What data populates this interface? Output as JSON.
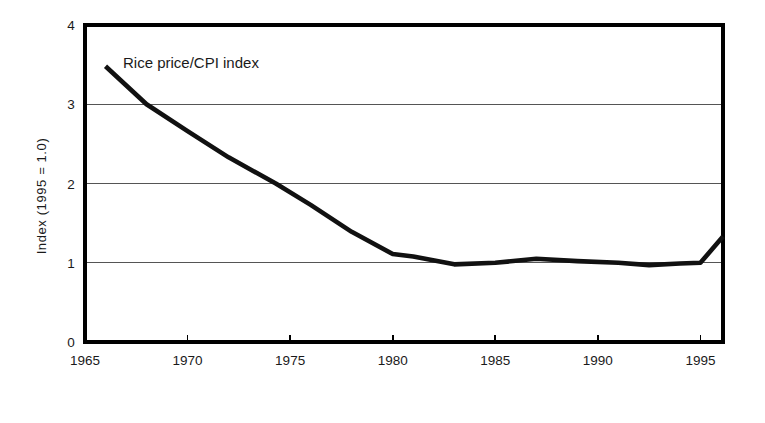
{
  "chart_data": {
    "type": "line",
    "title": "",
    "annotation": "Rice price/CPI index",
    "xlabel": "",
    "ylabel": "Index (1995 = 1.0)",
    "xlim": [
      1965,
      1996.1
    ],
    "ylim": [
      0,
      4
    ],
    "grid": "horizontal",
    "legend_position": "none",
    "xticks": [
      "1965",
      "1970",
      "1975",
      "1980",
      "1985",
      "1990",
      "1995"
    ],
    "xtick_values": [
      1965,
      1970,
      1975,
      1980,
      1985,
      1990,
      1995
    ],
    "yticks": [
      "0",
      "1",
      "2",
      "3",
      "4"
    ],
    "ytick_values": [
      0,
      1,
      2,
      3,
      4
    ],
    "series": [
      {
        "name": "Rice price/CPI index",
        "color": "#111111",
        "x": [
          1966.0,
          1968.0,
          1970.0,
          1972.0,
          1974.3,
          1976.0,
          1978.0,
          1980.0,
          1981.0,
          1983.0,
          1985.0,
          1987.0,
          1989.0,
          1991.0,
          1992.5,
          1994.0,
          1995.0,
          1996.1
        ],
        "values": [
          3.48,
          3.0,
          2.66,
          2.33,
          2.0,
          1.73,
          1.39,
          1.11,
          1.08,
          0.98,
          1.0,
          1.05,
          1.02,
          1.0,
          0.97,
          0.99,
          1.0,
          1.33
        ]
      }
    ]
  }
}
